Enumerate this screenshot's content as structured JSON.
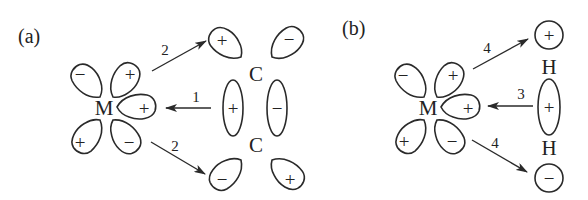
{
  "panels": [
    {
      "label": "(a)",
      "metal": "M",
      "metal_lobes": [
        "−",
        "+",
        "+",
        "+",
        "−"
      ],
      "ligand_atoms": [
        "C",
        "C"
      ],
      "ligand_orbitals": {
        "top_left": "+",
        "top_right": "−",
        "pi_left": "+",
        "pi_right": "−",
        "bottom_left": "−",
        "bottom_right": "+"
      },
      "arrows": [
        {
          "label": "2",
          "direction": "M → ligand (top)"
        },
        {
          "label": "1",
          "direction": "ligand → M"
        },
        {
          "label": "2",
          "direction": "M → ligand (bottom)"
        }
      ]
    },
    {
      "label": "(b)",
      "metal": "M",
      "metal_lobes": [
        "−",
        "+",
        "+",
        "+",
        "−"
      ],
      "ligand_atoms": [
        "H",
        "H"
      ],
      "ligand_orbitals": {
        "top": "+",
        "sigma": "+",
        "bottom": "−"
      },
      "arrows": [
        {
          "label": "4",
          "direction": "M → ligand (top)"
        },
        {
          "label": "3",
          "direction": "ligand → M"
        },
        {
          "label": "4",
          "direction": "M → ligand (bottom)"
        }
      ]
    }
  ]
}
